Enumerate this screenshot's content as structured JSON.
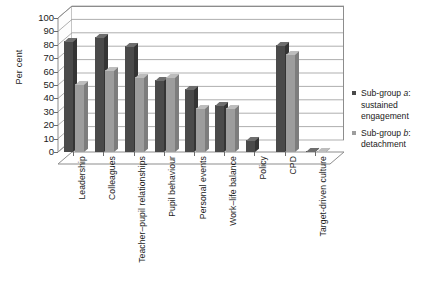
{
  "chart_data": {
    "type": "bar",
    "title": "",
    "xlabel": "",
    "ylabel": "Per cent",
    "ylim": [
      0,
      100
    ],
    "ytick_step": 10,
    "yticks": [
      0,
      10,
      20,
      30,
      40,
      50,
      60,
      70,
      80,
      90,
      100
    ],
    "grid": true,
    "legend_position": "right",
    "categories": [
      "Leadership",
      "Colleagues",
      "Teacher–pupil relationships",
      "Pupil behaviour",
      "Personal events",
      "Work–life balance",
      "Policy",
      "CPD",
      "Target-driven culture"
    ],
    "series": [
      {
        "name": "Sub-group a: sustained engagement",
        "color": "#4a4a4a",
        "values": [
          83,
          86,
          79,
          54,
          47,
          35,
          9,
          80,
          1
        ]
      },
      {
        "name": "Sub-group b: detachment",
        "color": "#9d9d9d",
        "values": [
          51,
          61,
          56,
          56,
          33,
          33,
          0,
          73,
          1
        ]
      }
    ]
  },
  "legend": {
    "items": [
      {
        "prefix": "Sub-group ",
        "emph": "a",
        "suffix": ":",
        "line2": "sustained",
        "line3": "engagement"
      },
      {
        "prefix": "Sub-group ",
        "emph": "b",
        "suffix": ":",
        "line2": "detachment",
        "line3": ""
      }
    ]
  },
  "axis": {
    "y_title": "Per cent"
  }
}
